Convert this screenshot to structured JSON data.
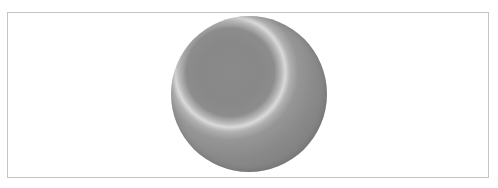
{
  "figure": {
    "colors": {
      "border": "#c4c4c4",
      "sphere_dark": "#7a7a7a",
      "sphere_mid": "#8a8a8a",
      "ring_highlight": "#dadada",
      "background": "#ffffff"
    }
  }
}
